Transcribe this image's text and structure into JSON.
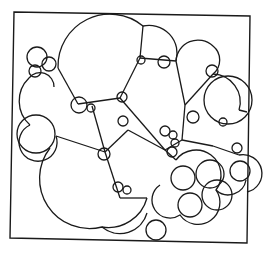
{
  "diagram": {
    "type": "circle-packing / foam cells",
    "stroke_color": "#1a1a1a",
    "background": "#ffffff",
    "frame": {
      "points": [
        [
          14,
          12
        ],
        [
          250,
          16
        ],
        [
          247,
          243
        ],
        [
          10,
          238
        ]
      ]
    },
    "arcs": [
      {
        "id": "big-top",
        "d": "M58,68 A52,52 0 0 1 143,26 A28,28 0 0 1 176,61"
      },
      {
        "id": "top-right-cap",
        "d": "M176,61 A22,22 0 0 1 213,46 A18,18 0 0 1 213,74"
      },
      {
        "id": "right-upper",
        "d": "M213,74 A28,28 0 0 1 239,110"
      },
      {
        "id": "left-small-stack",
        "d": "M29,78 A14,14 0 0 1 54,87"
      },
      {
        "id": "left-mid",
        "d": "M29,78 A32,32 0 0 0 30,125"
      },
      {
        "id": "left-lower",
        "d": "M30,125 A19,19 0 1 0 56,136"
      },
      {
        "id": "big-bottom-left",
        "d": "M50,148 A50,50 0 0 0 102,227 A40,40 0 0 0 147,198"
      },
      {
        "id": "bottom-arc",
        "d": "M102,227 A28,28 0 0 0 147,213"
      },
      {
        "id": "right-bottom-cluster",
        "d": "M176,160 A22,22 0 0 1 216,190 A20,20 0 0 1 180,215 A18,18 0 0 1 160,185"
      },
      {
        "id": "right-edge",
        "d": "M239,155 A18,18 0 0 1 247,192"
      },
      {
        "id": "lower-right",
        "d": "M216,190 A18,18 0 0 0 246,180"
      }
    ],
    "edges": [
      {
        "id": "e1",
        "d": "M58,68 L78,104"
      },
      {
        "id": "e2",
        "d": "M143,26 L140,58"
      },
      {
        "id": "e3",
        "d": "M120,98 L140,58"
      },
      {
        "id": "e4",
        "d": "M140,58 L176,61"
      },
      {
        "id": "e5",
        "d": "M176,61 L185,105"
      },
      {
        "id": "e6",
        "d": "M185,105 L213,74"
      },
      {
        "id": "e7",
        "d": "M185,105 L182,140"
      },
      {
        "id": "e8",
        "d": "M182,140 L213,146"
      },
      {
        "id": "e9",
        "d": "M182,140 L165,150"
      },
      {
        "id": "e10",
        "d": "M120,98 L165,150"
      },
      {
        "id": "e11",
        "d": "M78,104 L120,98"
      },
      {
        "id": "e12",
        "d": "M92,106 L105,152"
      },
      {
        "id": "e13",
        "d": "M56,136 L105,152"
      },
      {
        "id": "e14",
        "d": "M105,152 L128,130"
      },
      {
        "id": "e15",
        "d": "M128,130 L165,150"
      },
      {
        "id": "e16",
        "d": "M105,152 L120,198"
      },
      {
        "id": "e17",
        "d": "M120,198 L147,198"
      },
      {
        "id": "e18",
        "d": "M213,146 L239,155"
      },
      {
        "id": "e19",
        "d": "M239,110 L247,112"
      },
      {
        "id": "e20",
        "d": "M165,150 L176,160"
      }
    ],
    "circles": [
      {
        "id": "c-tl-a",
        "cx": 37,
        "cy": 57,
        "r": 10
      },
      {
        "id": "c-tl-b",
        "cx": 49,
        "cy": 64,
        "r": 7
      },
      {
        "id": "c-tl-c",
        "cx": 35,
        "cy": 71,
        "r": 6
      },
      {
        "id": "c-left-big",
        "cx": 36,
        "cy": 134,
        "r": 19
      },
      {
        "id": "c-j1",
        "cx": 79,
        "cy": 105,
        "r": 8
      },
      {
        "id": "c-j2",
        "cx": 91,
        "cy": 108,
        "r": 4
      },
      {
        "id": "c-j3",
        "cx": 122,
        "cy": 97,
        "r": 5
      },
      {
        "id": "c-j4",
        "cx": 141,
        "cy": 60,
        "r": 4
      },
      {
        "id": "c-j5",
        "cx": 164,
        "cy": 62,
        "r": 6
      },
      {
        "id": "c-j6",
        "cx": 212,
        "cy": 71,
        "r": 6
      },
      {
        "id": "c-j7",
        "cx": 123,
        "cy": 121,
        "r": 5
      },
      {
        "id": "c-j8",
        "cx": 104,
        "cy": 154,
        "r": 6
      },
      {
        "id": "c-j9",
        "cx": 193,
        "cy": 117,
        "r": 6
      },
      {
        "id": "c-j10",
        "cx": 223,
        "cy": 122,
        "r": 4
      },
      {
        "id": "c-j11",
        "cx": 165,
        "cy": 131,
        "r": 5
      },
      {
        "id": "c-j12",
        "cx": 173,
        "cy": 135,
        "r": 4
      },
      {
        "id": "c-j13",
        "cx": 175,
        "cy": 143,
        "r": 4
      },
      {
        "id": "c-j14",
        "cx": 172,
        "cy": 152,
        "r": 5
      },
      {
        "id": "c-j15",
        "cx": 237,
        "cy": 148,
        "r": 5
      },
      {
        "id": "c-j16",
        "cx": 118,
        "cy": 187,
        "r": 5
      },
      {
        "id": "c-j17",
        "cx": 127,
        "cy": 190,
        "r": 4
      },
      {
        "id": "c-br-a",
        "cx": 183,
        "cy": 178,
        "r": 12
      },
      {
        "id": "c-br-b",
        "cx": 210,
        "cy": 174,
        "r": 14
      },
      {
        "id": "c-br-c",
        "cx": 190,
        "cy": 205,
        "r": 12
      },
      {
        "id": "c-br-d",
        "cx": 217,
        "cy": 195,
        "r": 15
      },
      {
        "id": "c-br-e",
        "cx": 240,
        "cy": 171,
        "r": 10
      },
      {
        "id": "c-bottom",
        "cx": 156,
        "cy": 230,
        "r": 10
      },
      {
        "id": "c-mid-r",
        "cx": 228,
        "cy": 100,
        "r": 24
      }
    ]
  }
}
